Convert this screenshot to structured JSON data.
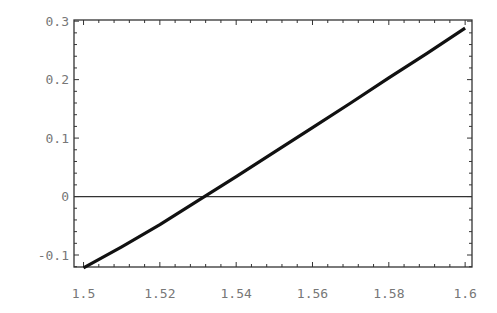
{
  "chart_data": {
    "type": "line",
    "title": "",
    "xlabel": "",
    "ylabel": "",
    "xlim": [
      1.4975,
      1.6018
    ],
    "ylim": [
      -0.1205,
      0.302
    ],
    "grid": false,
    "legend": null,
    "x_ticks": [
      1.5,
      1.52,
      1.54,
      1.56,
      1.58,
      1.6
    ],
    "x_tick_labels": [
      "1.5",
      "1.52",
      "1.54",
      "1.56",
      "1.58",
      "1.6"
    ],
    "y_ticks": [
      -0.1,
      0,
      0.1,
      0.2,
      0.3
    ],
    "y_tick_labels": [
      "-0.1",
      "0",
      "0.1",
      "0.2",
      "0.3"
    ],
    "series": [
      {
        "name": "curve",
        "color": "#111111",
        "x": [
          1.5,
          1.51,
          1.52,
          1.53,
          1.54,
          1.55,
          1.56,
          1.57,
          1.58,
          1.59,
          1.6
        ],
        "y": [
          -0.122,
          -0.086,
          -0.048,
          -0.007,
          0.034,
          0.076,
          0.118,
          0.16,
          0.203,
          0.245,
          0.288
        ]
      }
    ],
    "reference_lines": [
      {
        "axis": "y",
        "value": 0,
        "color": "#333333"
      }
    ],
    "annotations": []
  }
}
